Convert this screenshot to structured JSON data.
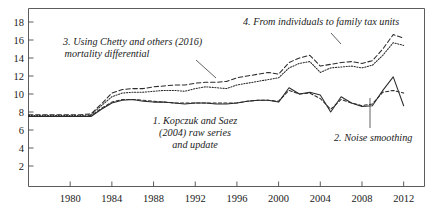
{
  "chart_data": {
    "type": "line",
    "title": "",
    "subtitle": "",
    "xlabel": "",
    "ylabel": "",
    "xlim": [
      1976,
      2014
    ],
    "ylim": [
      0,
      19
    ],
    "grid": false,
    "legend_position": "inline-annotations",
    "x_ticks": [
      1980,
      1984,
      1988,
      1992,
      1996,
      2000,
      2004,
      2008,
      2012
    ],
    "y_ticks": [
      2,
      4,
      6,
      8,
      10,
      12,
      14,
      16,
      18
    ],
    "x": [
      1976,
      1977,
      1978,
      1979,
      1980,
      1981,
      1982,
      1983,
      1984,
      1985,
      1986,
      1987,
      1988,
      1989,
      1990,
      1991,
      1992,
      1993,
      1994,
      1995,
      1996,
      1997,
      1998,
      1999,
      2000,
      2001,
      2002,
      2003,
      2004,
      2005,
      2006,
      2007,
      2008,
      2009,
      2010,
      2011,
      2012
    ],
    "series": [
      {
        "name": "1. Kopczuk and Saez (2004) raw series and update",
        "style": "solid",
        "values": [
          7.5,
          7.5,
          7.5,
          7.5,
          7.5,
          7.5,
          7.5,
          8.3,
          9.0,
          9.3,
          9.4,
          9.2,
          9.1,
          9.1,
          9.0,
          8.9,
          9.0,
          9.0,
          8.9,
          8.9,
          9.0,
          9.2,
          9.3,
          9.3,
          9.1,
          10.7,
          10.0,
          10.2,
          9.9,
          8.0,
          9.7,
          9.0,
          8.6,
          8.7,
          10.4,
          11.9,
          8.7
        ]
      },
      {
        "name": "2. Noise smoothing",
        "style": "dashed-short",
        "values": [
          7.5,
          7.5,
          7.5,
          7.5,
          7.5,
          7.5,
          7.6,
          8.4,
          9.1,
          9.4,
          9.4,
          9.3,
          9.2,
          9.1,
          9.0,
          9.0,
          9.0,
          9.0,
          9.0,
          9.0,
          9.0,
          9.2,
          9.3,
          9.3,
          9.2,
          10.4,
          10.0,
          10.1,
          9.5,
          8.3,
          9.4,
          9.0,
          8.7,
          8.9,
          10.2,
          10.4,
          10.1
        ]
      },
      {
        "name": "3. Using Chetty and others (2016) mortality differential",
        "style": "dotted",
        "values": [
          7.6,
          7.6,
          7.6,
          7.6,
          7.6,
          7.6,
          7.7,
          8.7,
          9.7,
          10.1,
          10.2,
          10.2,
          10.3,
          10.4,
          10.4,
          10.3,
          10.6,
          10.8,
          10.7,
          10.6,
          11.0,
          11.2,
          11.4,
          11.6,
          11.8,
          12.9,
          13.4,
          13.6,
          12.4,
          12.9,
          13.0,
          13.1,
          12.9,
          13.2,
          14.3,
          15.7,
          15.4
        ]
      },
      {
        "name": "4. From individuals to family tax units",
        "style": "dashed",
        "values": [
          7.7,
          7.7,
          7.7,
          7.7,
          7.7,
          7.7,
          7.8,
          8.9,
          10.1,
          10.5,
          10.6,
          10.6,
          10.8,
          10.9,
          11.0,
          11.0,
          11.2,
          11.3,
          11.3,
          11.4,
          11.8,
          12.0,
          12.2,
          12.4,
          12.2,
          13.5,
          14.0,
          14.3,
          13.1,
          13.3,
          13.5,
          13.6,
          13.4,
          13.7,
          15.0,
          16.6,
          16.2
        ]
      }
    ],
    "annotations": [
      {
        "id": "annotation-4",
        "lines": [
          "4. From individuals to family tax units"
        ],
        "anchor": "series-4"
      },
      {
        "id": "annotation-3",
        "lines": [
          "3. Using Chetty and others (2016)",
          "mortality differential"
        ],
        "anchor": "series-3"
      },
      {
        "id": "annotation-1",
        "lines": [
          "1. Kopczuk and Saez",
          "(2004) raw series",
          "and update"
        ],
        "anchor": "series-1"
      },
      {
        "id": "annotation-2",
        "lines": [
          "2. Noise smoothing"
        ],
        "anchor": "series-2"
      }
    ]
  },
  "axis": {
    "x_tick_labels": [
      "1980",
      "1984",
      "1988",
      "1992",
      "1996",
      "2000",
      "2004",
      "2008",
      "2012"
    ],
    "y_tick_labels": [
      "2",
      "4",
      "6",
      "8",
      "10",
      "12",
      "14",
      "16",
      "18"
    ]
  },
  "annotations": {
    "a4_l1": "4. From individuals to family tax units",
    "a3_l1": "3. Using Chetty and others (2016)",
    "a3_l2": "mortality differential",
    "a1_l1": "1. Kopczuk and Saez",
    "a1_l2": "(2004) raw series",
    "a1_l3": "and update",
    "a2_l1": "2. Noise smoothing"
  },
  "colors": {
    "line": "#2b2b2b",
    "axis": "#4a4a4a",
    "text": "#1a1a1a",
    "background": "#ffffff"
  }
}
